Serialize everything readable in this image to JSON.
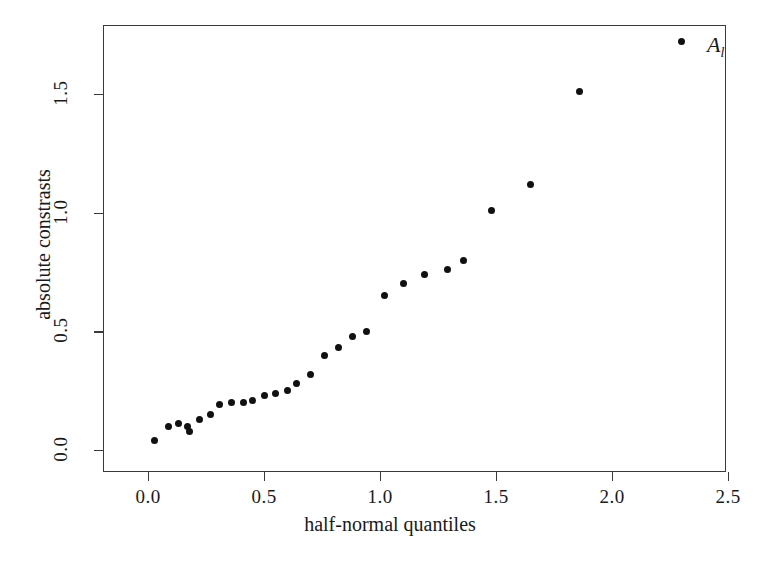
{
  "chart_data": {
    "type": "scatter",
    "title": "",
    "xlabel": "half-normal quantiles",
    "ylabel": "absolute constrasts",
    "xlim": [
      -0.19,
      2.5
    ],
    "ylim": [
      -0.06,
      1.82
    ],
    "xticks": [
      "0.0",
      "0.5",
      "1.0",
      "1.5",
      "2.0",
      "2.5"
    ],
    "xtick_values": [
      0.0,
      0.5,
      1.0,
      1.5,
      2.0,
      2.5
    ],
    "yticks": [
      "0.0",
      "0.5",
      "1.0",
      "1.5"
    ],
    "ytick_values": [
      0.0,
      0.5,
      1.0,
      1.5
    ],
    "grid": false,
    "legend": false,
    "marker": "filled-circle",
    "marker_color": "#111111",
    "frame_color": "#3a3a3a",
    "x": [
      0.03,
      0.09,
      0.13,
      0.17,
      0.18,
      0.22,
      0.27,
      0.31,
      0.36,
      0.41,
      0.45,
      0.5,
      0.55,
      0.6,
      0.64,
      0.7,
      0.76,
      0.82,
      0.88,
      0.94,
      1.02,
      1.1,
      1.19,
      1.29,
      1.36,
      1.48,
      1.65,
      1.86,
      2.3
    ],
    "y": [
      0.04,
      0.1,
      0.11,
      0.1,
      0.08,
      0.13,
      0.15,
      0.19,
      0.2,
      0.2,
      0.21,
      0.23,
      0.24,
      0.25,
      0.28,
      0.32,
      0.4,
      0.43,
      0.48,
      0.5,
      0.65,
      0.7,
      0.74,
      0.76,
      0.8,
      1.01,
      1.12,
      1.51,
      1.72
    ],
    "annotations": [
      {
        "label": "A",
        "sublabel": "l",
        "x": 2.41,
        "y": 1.7
      }
    ],
    "n_points": 29
  }
}
